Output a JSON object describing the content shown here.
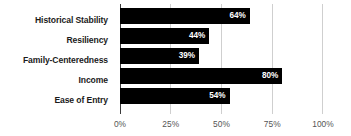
{
  "chart_data": {
    "type": "bar",
    "orientation": "horizontal",
    "title": "",
    "subtitle": "",
    "xlabel": "",
    "ylabel": "",
    "categories": [
      "Historical Stability",
      "Resiliency",
      "Family-Centeredness",
      "Income",
      "Ease of Entry"
    ],
    "values": [
      64,
      44,
      39,
      80,
      54
    ],
    "value_labels": [
      "64%",
      "44%",
      "39%",
      "80%",
      "54%"
    ],
    "xlim": [
      0,
      100
    ],
    "xticks": [
      0,
      25,
      50,
      75,
      100
    ],
    "xtick_labels": [
      "0%",
      "25%",
      "50%",
      "75%",
      "100%"
    ],
    "grid": true,
    "grid_axis": "x",
    "legend": false,
    "legend_position": "none",
    "bar_color": "#000000",
    "value_label_color": "#ffffff",
    "gridline_color": "#cfcfcf",
    "axis_line_color": "#3a3a3a",
    "category_label_color": "#1b1b1b",
    "tick_label_color": "#555555",
    "background_color": "#ffffff"
  }
}
